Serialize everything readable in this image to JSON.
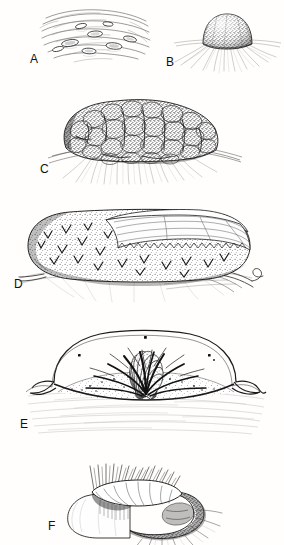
{
  "plate": {
    "title": "Developmental series plate",
    "background_color": "#ffffff",
    "ink_color": "#1a1a1a",
    "width": 284,
    "height": 545,
    "style": "pen-and-ink stipple line engraving",
    "panel_count": 6
  },
  "panels": [
    {
      "id": "A",
      "label": "A",
      "label_x": 30,
      "label_y": 52,
      "subject": "early flattened stage with wavy surface folds and scattered oval cells",
      "box": {
        "x": 38,
        "y": 6,
        "width": 108,
        "height": 62
      }
    },
    {
      "id": "B",
      "label": "B",
      "label_x": 166,
      "label_y": 55,
      "subject": "small dome-shaped stippled mound with radiating basal filaments",
      "box": {
        "x": 176,
        "y": 8,
        "width": 104,
        "height": 64
      }
    },
    {
      "id": "C",
      "label": "C",
      "label_x": 40,
      "label_y": 162,
      "subject": "large lobulated cauliflower-like mass seated on substrate with root fibers",
      "box": {
        "x": 52,
        "y": 92,
        "width": 186,
        "height": 92
      }
    },
    {
      "id": "D",
      "label": "D",
      "label_x": 14,
      "label_y": 277,
      "subject": "elongated sausage-shaped body with cut-away flap exposing inner lamellae",
      "box": {
        "x": 26,
        "y": 204,
        "width": 238,
        "height": 98
      }
    },
    {
      "id": "E",
      "label": "E",
      "label_x": 20,
      "label_y": 417,
      "subject": "longitudinal section showing finger-like villi, branching canals and enclosing membrane",
      "box": {
        "x": 32,
        "y": 322,
        "width": 224,
        "height": 112
      }
    },
    {
      "id": "F",
      "label": "F",
      "label_x": 48,
      "label_y": 519,
      "subject": "curved annular tube bearing a crown of bristles along the inner rim",
      "box": {
        "x": 62,
        "y": 466,
        "width": 162,
        "height": 76
      }
    }
  ]
}
